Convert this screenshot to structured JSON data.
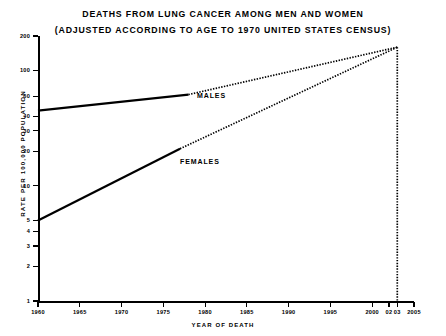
{
  "title": {
    "line1": "DEATHS FROM LUNG CANCER AMONG MEN AND WOMEN",
    "line2": "(ADJUSTED ACCORDING TO AGE TO 1970 UNITED STATES CENSUS)"
  },
  "axes": {
    "ylabel": "RATE PER 100,000 POPULATION",
    "xlabel": "YEAR OF DEATH"
  },
  "series_labels": {
    "males": "MALES",
    "females": "FEMALES"
  },
  "chart_data": {
    "type": "line",
    "title": "DEATHS FROM LUNG CANCER AMONG MEN AND WOMEN (ADJUSTED ACCORDING TO AGE TO 1970 UNITED STATES CENSUS)",
    "xlabel": "YEAR OF DEATH",
    "ylabel": "RATE PER 100,000 POPULATION",
    "yscale": "log",
    "ylim": [
      1,
      200
    ],
    "xlim": [
      1960,
      2005
    ],
    "grid": false,
    "legend": "inline-annotations",
    "yticks": [
      200,
      100,
      60,
      40,
      30,
      20,
      10,
      5,
      4,
      3,
      2,
      1
    ],
    "ytick_labels": [
      "200",
      "100",
      "60",
      "40",
      "30",
      "20",
      "10",
      "5",
      "4",
      "3",
      "2",
      "1"
    ],
    "xticks": [
      1960,
      1965,
      1970,
      1975,
      1980,
      1985,
      1990,
      1995,
      2000,
      2002,
      2003,
      2005
    ],
    "xtick_labels": [
      "1960",
      "1965",
      "1970",
      "1975",
      "1980",
      "1985",
      "1990",
      "1995",
      "2000",
      "02",
      "03",
      "2005"
    ],
    "series": [
      {
        "name": "MALES",
        "style": "solid-then-dotted",
        "observed": [
          {
            "x": 1960,
            "y": 45
          },
          {
            "x": 1978,
            "y": 62
          }
        ],
        "projected": [
          {
            "x": 1978,
            "y": 62
          },
          {
            "x": 2003,
            "y": 160
          }
        ]
      },
      {
        "name": "FEMALES",
        "style": "solid-then-dotted",
        "observed": [
          {
            "x": 1960,
            "y": 5
          },
          {
            "x": 1977,
            "y": 21
          }
        ],
        "projected": [
          {
            "x": 1977,
            "y": 21
          },
          {
            "x": 2003,
            "y": 160
          }
        ]
      }
    ],
    "annotations": [
      {
        "text": "MALES",
        "x": 1978,
        "y": 55
      },
      {
        "text": "FEMALES",
        "x": 1976,
        "y": 16
      },
      {
        "text": "convergence marker",
        "type": "vertical-dotted-line",
        "x": 2003
      }
    ]
  }
}
